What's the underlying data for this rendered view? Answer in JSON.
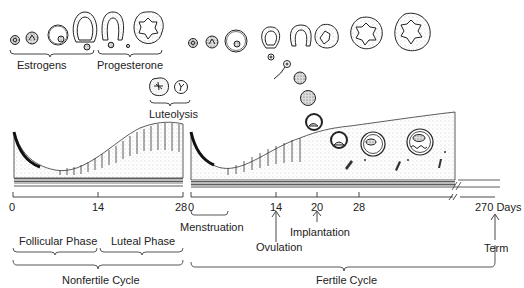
{
  "diagram": {
    "title": "",
    "top_labels": {
      "estrogens": "Estrogens",
      "progesterone": "Progesterone",
      "luteolysis": "Luteolysis"
    },
    "axis": {
      "nonfertile_ticks": [
        "0",
        "14",
        "28"
      ],
      "fertile_ticks": [
        "0",
        "14",
        "20",
        "28"
      ],
      "end_tick": "270 Days",
      "break_symbol": "//"
    },
    "events": {
      "menstruation": "Menstruation",
      "ovulation": "Ovulation",
      "implantation": "Implantation",
      "term": "Term"
    },
    "phases": {
      "follicular": "Follicular Phase",
      "luteal": "Luteal Phase"
    },
    "cycles": {
      "nonfertile": "Nonfertile Cycle",
      "fertile": "Fertile Cycle"
    },
    "colors": {
      "ink": "#222222",
      "background": "#ffffff",
      "stipple": "#9a9a9a"
    }
  }
}
